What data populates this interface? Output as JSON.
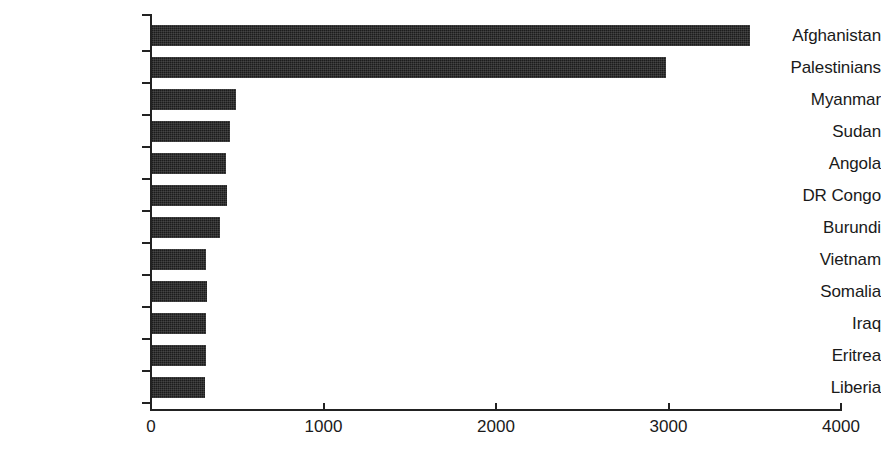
{
  "chart_data": {
    "type": "bar",
    "orientation": "horizontal",
    "title": "",
    "subtitle": "",
    "xlabel": "",
    "ylabel": "",
    "xlim": [
      0,
      4000
    ],
    "ylim": null,
    "grid": false,
    "legend": null,
    "bar_color": "#1c1c1c",
    "axis_color": "#222222",
    "background_color": "#ffffff",
    "xticks": [
      0,
      1000,
      2000,
      3000,
      4000
    ],
    "xtick_labels": [
      "0",
      "1000",
      "2000",
      "3000",
      "4000"
    ],
    "categories": [
      "Afghanistan",
      "Palestinians",
      "Myanmar",
      "Sudan",
      "Angola",
      "DR Congo",
      "Burundi",
      "Vietnam",
      "Somalia",
      "Iraq",
      "Eritrea",
      "Liberia"
    ],
    "values": [
      3475,
      2985,
      490,
      460,
      435,
      440,
      400,
      320,
      325,
      320,
      320,
      315
    ],
    "series": [
      {
        "name": "",
        "values": [
          3475,
          2985,
          490,
          460,
          435,
          440,
          400,
          320,
          325,
          320,
          320,
          315
        ]
      }
    ]
  },
  "axis": {
    "x_origin_px": 151,
    "x_full_px": 841,
    "px_per_unit": 0.1725
  }
}
